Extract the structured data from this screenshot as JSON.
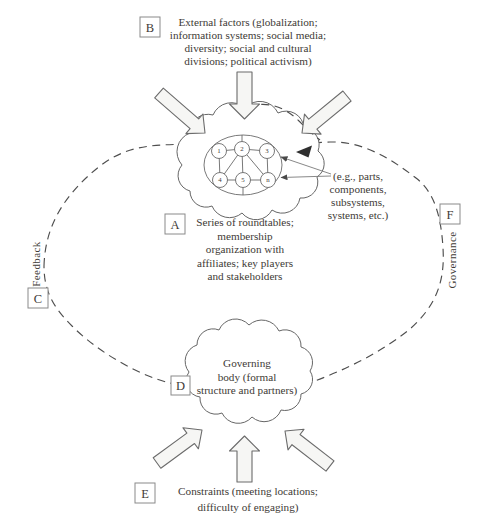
{
  "colors": {
    "ink": "#3e3a36",
    "line": "#5c5c5c",
    "arrow_fill": "#f6f6f4",
    "arrowhead": "#2f2f2f"
  },
  "boxes": {
    "a": "A",
    "b": "B",
    "c": "C",
    "d": "D",
    "e": "E",
    "f": "F"
  },
  "external_factors": {
    "lines": [
      "External factors (globalization;",
      "information systems; social media;",
      "diversity; social and cultural",
      "divisions; political activism)"
    ]
  },
  "roundtables": {
    "lines": [
      "Series of roundtables;",
      "membership",
      "organization with",
      "affiliates; key players",
      "and stakeholders"
    ]
  },
  "eg_parts": {
    "lines": [
      "(e.g., parts,",
      "components,",
      "subsystems,",
      "systems, etc.)"
    ]
  },
  "governing_body": {
    "lines": [
      "Governing",
      "body (formal",
      "structure and partners)"
    ]
  },
  "constraints": {
    "lines": [
      "Constraints (meeting locations;",
      "difficulty of engaging)"
    ]
  },
  "side_labels": {
    "feedback": "Feedback",
    "governance": "Governance"
  },
  "network": {
    "nodes": [
      "1",
      "2",
      "3",
      "4",
      "5",
      "n"
    ]
  }
}
